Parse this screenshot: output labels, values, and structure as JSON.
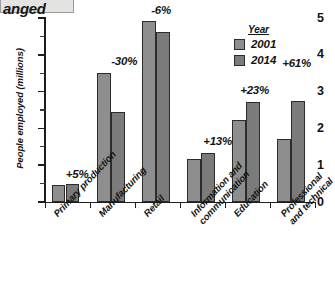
{
  "title": {
    "text": "anged",
    "note": "cut-off heading strip at top edge"
  },
  "chart_data": {
    "type": "bar",
    "title": "",
    "xlabel": "",
    "ylabel": "People employed (millions)",
    "ylim": [
      0,
      5
    ],
    "y_ticks": [
      "0",
      "1",
      "2",
      "3",
      "4",
      "5"
    ],
    "y_minor_step": 0.5,
    "grid": false,
    "legend_title": "Year",
    "legend_position": "top-right",
    "categories": [
      "Primary production",
      "Manufacturing",
      "Retail",
      "Information and\ncommunication",
      "Education",
      "Professional\nand technical"
    ],
    "series": [
      {
        "name": "2001",
        "color": "#8e8e8e",
        "values": [
          0.47,
          3.5,
          4.93,
          1.18,
          2.22,
          1.7
        ]
      },
      {
        "name": "2014",
        "color": "#7b7b7b",
        "values": [
          0.5,
          2.45,
          4.63,
          1.33,
          2.73,
          2.75
        ]
      }
    ],
    "annotations": [
      "+5%",
      "-30%",
      "-6%",
      "+13%",
      "+23%",
      "+61%"
    ]
  }
}
